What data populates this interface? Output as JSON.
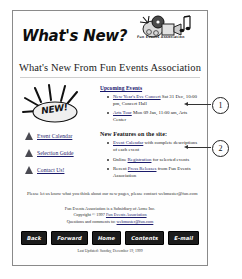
{
  "header": {
    "whats_new_title": "What's New?",
    "logo_caption": "Fun Events Association",
    "logo_icon": "movie-camera-music-note-icon"
  },
  "main_heading": "What's New From Fun Events Association",
  "sidebar": {
    "burst_label": "NEW!",
    "burst_icon": "new-starburst-icon",
    "links": [
      {
        "label": "Event Calendar",
        "icon": "triangle-bullet-icon"
      },
      {
        "label": "Selection Guide",
        "icon": "triangle-bullet-icon"
      },
      {
        "label": "Contact Us!",
        "icon": "triangle-bullet-icon"
      }
    ]
  },
  "content": {
    "upcoming_heading": "Upcoming Events",
    "upcoming_events": [
      {
        "link": "New Year's Eve Concert",
        "detail": " Sat 31 Dec, 10:00 pm, Concert Hall"
      },
      {
        "link": "Arts Tour",
        "detail": " Mon 09 Jan, 11:00 am, Arts Center"
      }
    ],
    "features_heading": "New Features on the site:",
    "features": [
      {
        "link": "Event Calendar",
        "detail": " with complete descriptions of each event"
      },
      {
        "pre": "Online ",
        "link": "Registration",
        "detail": " for selected events"
      },
      {
        "pre": "Recent ",
        "link": "Press Releases",
        "detail": " from Fun Events Association"
      }
    ],
    "closing": "Please let us know what you think about our new pages, please contact webmaster@fun.com"
  },
  "footer": {
    "line1": "Fun Events Association is a Subsidiary of Acme Inc.",
    "line2_pre": "Copyright © 1997 ",
    "line2_link": "Fun Events Association",
    "line3_pre": "Questions and comments to: ",
    "line3_link": "webmaster@fun.com",
    "last_modified": "Last Updated: Sunday, December 19, 1999"
  },
  "navbar": {
    "buttons": [
      "Back",
      "Forward",
      "Home",
      "Contents",
      "E-mail"
    ]
  },
  "callouts": [
    {
      "number": "1"
    },
    {
      "number": "2"
    }
  ]
}
